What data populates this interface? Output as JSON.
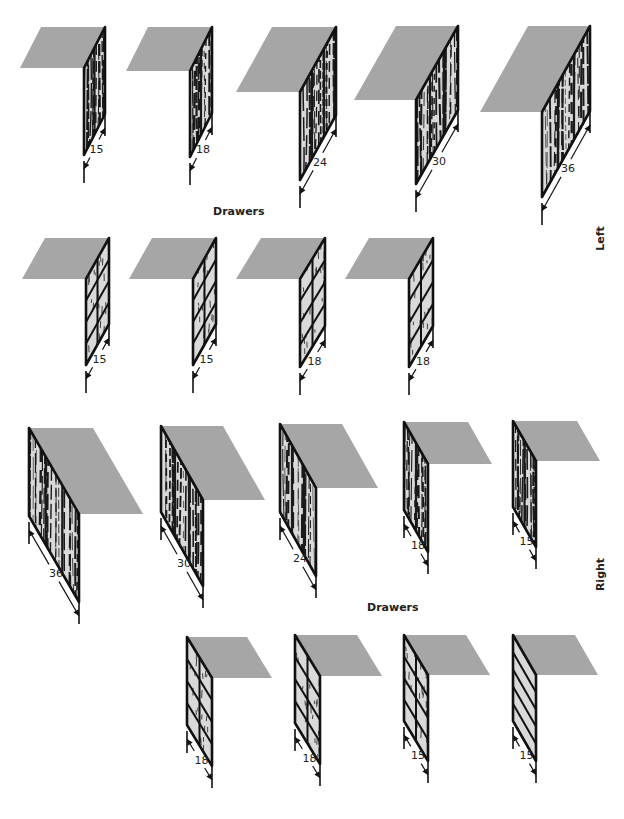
{
  "labels": {
    "drawers_top": "Drawers",
    "drawers_bottom": "Drawers",
    "left": "Left",
    "right": "Right"
  },
  "colors": {
    "top_surface": "#a6a6a6",
    "panel_fill": "#d9d9d9",
    "outline": "#111111",
    "grain": "#1a1a1a"
  },
  "sections": [
    {
      "name": "left-doors",
      "side": "left",
      "style": "door",
      "units": [
        {
          "size": "15",
          "hx": 84,
          "hy": 68,
          "w": 21,
          "rise": 41,
          "h": 87,
          "topw": 64
        },
        {
          "size": "18",
          "hx": 190,
          "hy": 71,
          "w": 22,
          "rise": 44,
          "h": 86,
          "topw": 64
        },
        {
          "size": "24",
          "hx": 300,
          "hy": 92,
          "w": 36,
          "rise": 65,
          "h": 88,
          "topw": 64
        },
        {
          "size": "30",
          "hx": 416,
          "hy": 100,
          "w": 42,
          "rise": 74,
          "h": 84,
          "topw": 62
        },
        {
          "size": "36",
          "hx": 542,
          "hy": 112,
          "w": 48,
          "rise": 86,
          "h": 85,
          "topw": 62
        }
      ]
    },
    {
      "name": "left-drawers",
      "side": "left",
      "style": "drawer-grid",
      "units": [
        {
          "size": "15",
          "hx": 86,
          "hy": 279,
          "w": 23,
          "rise": 41,
          "h": 86,
          "topw": 64,
          "rows": 4,
          "cols": 2
        },
        {
          "size": "15",
          "hx": 193,
          "hy": 279,
          "w": 23,
          "rise": 41,
          "h": 86,
          "topw": 64,
          "rows": 4,
          "cols": 2
        },
        {
          "size": "18",
          "hx": 300,
          "hy": 279,
          "w": 25,
          "rise": 41,
          "h": 88,
          "topw": 64,
          "rows": 4,
          "cols": 2
        },
        {
          "size": "18",
          "hx": 409,
          "hy": 279,
          "w": 24,
          "rise": 41,
          "h": 88,
          "topw": 64,
          "rows": 4,
          "cols": 2
        }
      ]
    },
    {
      "name": "right-doors",
      "side": "right",
      "style": "door",
      "units": [
        {
          "size": "36",
          "hx": 29,
          "hy": 428,
          "w": 50,
          "rise": 86,
          "h": 88,
          "topw": 64
        },
        {
          "size": "30",
          "hx": 161,
          "hy": 426,
          "w": 42,
          "rise": 74,
          "h": 86,
          "topw": 62
        },
        {
          "size": "24",
          "hx": 280,
          "hy": 424,
          "w": 36,
          "rise": 64,
          "h": 88,
          "topw": 62
        },
        {
          "size": "18",
          "hx": 404,
          "hy": 422,
          "w": 24,
          "rise": 42,
          "h": 88,
          "topw": 64
        },
        {
          "size": "15",
          "hx": 513,
          "hy": 421,
          "w": 23,
          "rise": 40,
          "h": 86,
          "topw": 64
        }
      ]
    },
    {
      "name": "right-drawers",
      "side": "right",
      "style": "drawer-grid",
      "units": [
        {
          "size": "18",
          "hx": 187,
          "hy": 637,
          "w": 25,
          "rise": 41,
          "h": 88,
          "topw": 60,
          "rows": 4,
          "cols": 2
        },
        {
          "size": "18",
          "hx": 295,
          "hy": 635,
          "w": 25,
          "rise": 41,
          "h": 88,
          "topw": 62,
          "rows": 4,
          "cols": 2
        },
        {
          "size": "15",
          "hx": 404,
          "hy": 635,
          "w": 24,
          "rise": 40,
          "h": 86,
          "topw": 62,
          "rows": 4,
          "cols": 2
        },
        {
          "size": "15",
          "hx": 513,
          "hy": 635,
          "w": 23,
          "rise": 40,
          "h": 86,
          "topw": 62,
          "rows": 5,
          "cols": 1,
          "plain": true
        }
      ]
    }
  ]
}
